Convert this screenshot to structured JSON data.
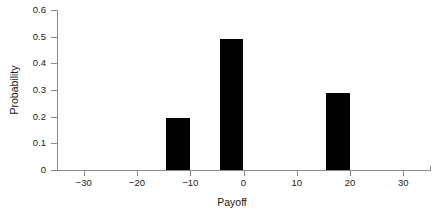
{
  "chart_data": {
    "type": "bar",
    "title": "",
    "subtitle": "",
    "xlabel": "Payoff",
    "ylabel": "Probability",
    "categories": [
      -10,
      0,
      20
    ],
    "values": [
      0.195,
      0.49,
      0.29
    ],
    "series": [
      {
        "name": "Probability",
        "values": [
          0.195,
          0.49,
          0.29
        ]
      }
    ],
    "x": [
      -10,
      0,
      20
    ],
    "xlim": [
      -35,
      35
    ],
    "ylim": [
      0,
      0.6
    ],
    "xticks": [
      -30,
      -20,
      -10,
      0,
      10,
      20,
      30
    ],
    "xtick_labels": [
      "−30",
      "−20",
      "−10",
      "0",
      "10",
      "20",
      "30"
    ],
    "yticks": [
      0,
      0.1,
      0.2,
      0.3,
      0.4,
      0.5,
      0.6
    ],
    "ytick_labels": [
      "0",
      "0.1",
      "0.2",
      "0.3",
      "0.4",
      "0.5",
      "0.6"
    ],
    "grid": false,
    "legend": "none",
    "bar_color": "#000000",
    "axis_color": "#8a8a8a",
    "background_color": "#ffffff",
    "bar_width_units": 4.5,
    "annotations": []
  }
}
